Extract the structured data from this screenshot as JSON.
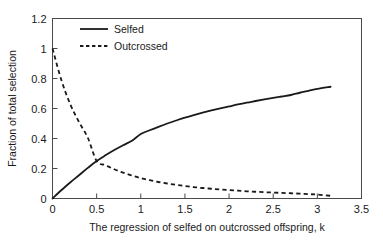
{
  "chart_data": {
    "type": "line",
    "title": "",
    "xlabel": "The regression of selfed on outcrossed offspring, k",
    "ylabel": "Fraction of total selection",
    "xlim": [
      0,
      3.5
    ],
    "ylim": [
      0,
      1.2
    ],
    "xticks": [
      "0",
      "0.5",
      "1",
      "1.5",
      "2",
      "2.5",
      "3",
      "3.5"
    ],
    "xtick_values": [
      0,
      0.5,
      1,
      1.5,
      2,
      2.5,
      3,
      3.5
    ],
    "yticks": [
      "0",
      "0.2",
      "0.4",
      "0.6",
      "0.8",
      "1",
      "1.2"
    ],
    "ytick_values": [
      0,
      0.2,
      0.4,
      0.6,
      0.8,
      1,
      1.2
    ],
    "grid": false,
    "legend_position": "top-left-inside",
    "frame": "box",
    "series": [
      {
        "name": "Selfed",
        "style": "solid",
        "color": "#1a1a1a",
        "x": [
          0,
          0.1,
          0.2,
          0.3,
          0.4,
          0.5,
          0.6,
          0.7,
          0.8,
          0.9,
          1.0,
          1.1,
          1.2,
          1.3,
          1.4,
          1.5,
          1.6,
          1.7,
          1.8,
          1.9,
          2.0,
          2.1,
          2.2,
          2.3,
          2.4,
          2.5,
          2.6,
          2.7,
          2.8,
          2.9,
          3.0,
          3.15
        ],
        "values": [
          0.0,
          0.055,
          0.107,
          0.155,
          0.204,
          0.25,
          0.288,
          0.323,
          0.355,
          0.385,
          0.43,
          0.455,
          0.478,
          0.5,
          0.52,
          0.539,
          0.556,
          0.572,
          0.587,
          0.601,
          0.614,
          0.627,
          0.639,
          0.65,
          0.661,
          0.671,
          0.68,
          0.69,
          0.705,
          0.718,
          0.731,
          0.745
        ]
      },
      {
        "name": "Outcrossed",
        "style": "dashed",
        "color": "#1a1a1a",
        "x": [
          0,
          0.1,
          0.2,
          0.3,
          0.4,
          0.5,
          0.6,
          0.7,
          0.8,
          0.9,
          1.0,
          1.1,
          1.2,
          1.3,
          1.4,
          1.5,
          1.6,
          1.7,
          1.8,
          1.9,
          2.0,
          2.1,
          2.2,
          2.3,
          2.4,
          2.5,
          2.6,
          2.7,
          2.8,
          2.9,
          3.0,
          3.15
        ],
        "values": [
          1.0,
          0.79,
          0.63,
          0.51,
          0.405,
          0.25,
          0.222,
          0.195,
          0.172,
          0.153,
          0.136,
          0.122,
          0.11,
          0.1,
          0.091,
          0.083,
          0.076,
          0.07,
          0.065,
          0.06,
          0.056,
          0.052,
          0.048,
          0.045,
          0.042,
          0.04,
          0.037,
          0.035,
          0.032,
          0.029,
          0.026,
          0.018
        ]
      }
    ],
    "annotations": []
  },
  "legend": {
    "items": [
      {
        "label": "Selfed",
        "style": "solid"
      },
      {
        "label": "Outcrossed",
        "style": "dashed"
      }
    ]
  },
  "axes": {
    "x_title": "The regression of selfed on outcrossed offspring, k",
    "y_title": "Fraction of total selection"
  }
}
